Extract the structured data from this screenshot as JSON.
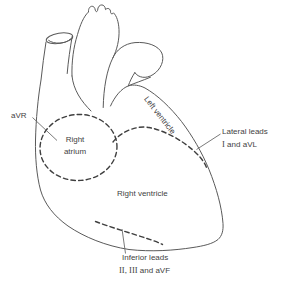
{
  "figure": {
    "labels": {
      "avr": "aVR",
      "right_atrium": {
        "line1": "Right",
        "line2": "atrium"
      },
      "left_ventricle": "Left ventricle",
      "right_ventricle": "Right ventricle",
      "lateral_leads": {
        "line1": "Lateral leads",
        "numeral": "I",
        "rest": "and aVL"
      },
      "inferior_leads": {
        "line1": "Inferior leads",
        "numerals": "II, III",
        "rest": "and aVF"
      }
    },
    "colors": {
      "outline": "#5a5a5a",
      "dashed_boundary": "#3f3f3f",
      "pointer_line": "#6b6b6b",
      "text": "#3f3f3f",
      "background": "#ffffff"
    }
  }
}
